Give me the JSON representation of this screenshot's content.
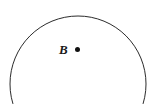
{
  "figure": {
    "type": "geometry-diagram",
    "background_color": "#ffffff",
    "stroke_color": "#2b2b2b",
    "stroke_width": 1,
    "canvas": {
      "width": 158,
      "height": 104
    },
    "shapes": {
      "circle": {
        "name": "circle-outline",
        "center_x": 78,
        "center_y": 84,
        "radius": 68,
        "fill": "none",
        "clipped_at_bottom": true
      },
      "center_point": {
        "name": "center-point-B",
        "cx": 77.5,
        "cy": 49.5,
        "r": 2.5,
        "fill": "#111111"
      }
    },
    "labels": [
      {
        "id": "B",
        "text": "B",
        "style": "italic-serif-bold",
        "color": "#1a1a1a",
        "font_size": 13,
        "x": 59,
        "y": 43
      }
    ]
  }
}
